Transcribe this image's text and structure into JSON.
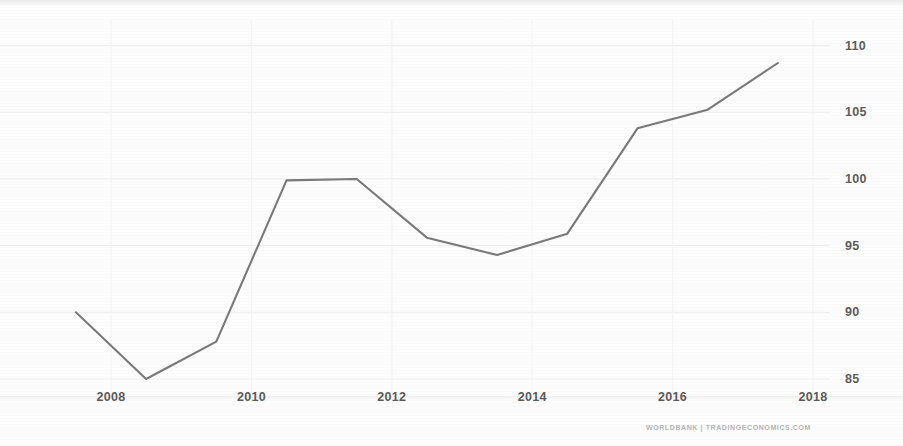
{
  "attribution": "WORLDBANK | TRADINGECONOMICS.COM",
  "axis": {
    "y_ticks": [
      "110",
      "105",
      "100",
      "95",
      "90",
      "85"
    ],
    "x_ticks": [
      "2008",
      "2010",
      "2012",
      "2014",
      "2016",
      "2018"
    ]
  },
  "chart_data": {
    "type": "line",
    "title": "",
    "subtitle": "",
    "xlabel": "",
    "ylabel": "",
    "source": "WORLDBANK | TRADINGECONOMICS.COM",
    "line_color": "#6e6e6e",
    "background_color": "#fdfdfd",
    "grid": true,
    "grid_color": "#ededed",
    "legend": null,
    "legend_position": "none",
    "xlim": [
      2007.2,
      2018.6
    ],
    "ylim": [
      83.5,
      111.5
    ],
    "x_tick_values": [
      2008,
      2010,
      2012,
      2014,
      2016,
      2018
    ],
    "y_tick_values": [
      110,
      105,
      100,
      95,
      90,
      85
    ],
    "x": [
      2007.5,
      2008.5,
      2009.5,
      2010.5,
      2011.5,
      2012.5,
      2013.5,
      2014.5,
      2015.5,
      2016.5,
      2017.5
    ],
    "values": [
      90.0,
      85.0,
      87.8,
      99.9,
      100.0,
      95.6,
      94.3,
      95.9,
      103.8,
      105.2,
      108.7
    ],
    "series": [
      {
        "name": "index",
        "values": [
          90.0,
          85.0,
          87.8,
          99.9,
          100.0,
          95.6,
          94.3,
          95.9,
          103.8,
          105.2,
          108.7
        ]
      }
    ]
  }
}
